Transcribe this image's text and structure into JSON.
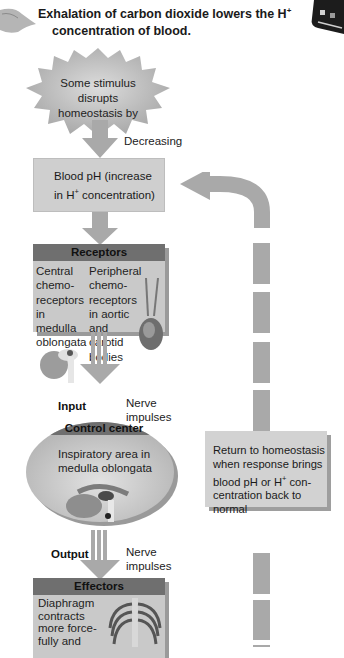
{
  "title": {
    "line1": "Exhalation of carbon dioxide lowers the H",
    "line1_sup": "+",
    "line2": "concentration of blood."
  },
  "stimulus": {
    "text_line1": "Some stimulus disrupts",
    "text_line2": "homeostasis by",
    "direction_label": "Decreasing"
  },
  "controlled_variable": {
    "line1": "Blood pH (increase",
    "line2_pre": "in H",
    "line2_sup": "+",
    "line2_post": " concentration)"
  },
  "receptors": {
    "header": "Receptors",
    "central": [
      "Central",
      "chemo-",
      "receptors",
      "in",
      "medulla",
      "oblongata"
    ],
    "peripheral": [
      "Peripheral",
      "chemo-",
      "receptors",
      "in aortic",
      "and",
      "carotid",
      "bodies"
    ]
  },
  "input": {
    "label": "Input",
    "signal_line1": "Nerve",
    "signal_line2": "impulses"
  },
  "control_center": {
    "header": "Control center",
    "line1": "Inspiratory area in",
    "line2": "medulla oblongata"
  },
  "output": {
    "label": "Output",
    "signal_line1": "Nerve",
    "signal_line2": "impulses"
  },
  "effectors": {
    "header": "Effectors",
    "lines": [
      "Diaphragm",
      "contracts",
      "more force-",
      "fully and"
    ]
  },
  "feedback": {
    "line1": "Return to homeostasis",
    "line2": "when response brings",
    "line3_pre": "blood pH or H",
    "line3_sup": "+",
    "line3_post": " con-",
    "line4": "centration back to",
    "line5": "normal"
  },
  "colors": {
    "box_fill": "#c9c9c9",
    "header_fill": "#6f6f6f",
    "arrow": "#a9a9a9",
    "shadow": "#9a9a9a"
  }
}
